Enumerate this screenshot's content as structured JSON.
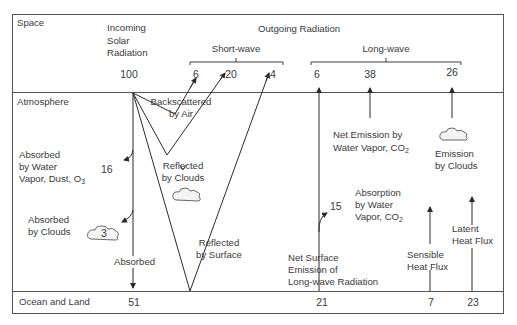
{
  "zones": {
    "space": "Space",
    "atmosphere": "Atmosphere",
    "surface": "Ocean and Land"
  },
  "headers": {
    "incoming": [
      "Incoming",
      "Solar",
      "Radiation"
    ],
    "outgoing": "Outgoing Radiation",
    "short_wave": "Short-wave",
    "long_wave": "Long-wave"
  },
  "top_values": {
    "incoming": "100",
    "backscattered": "6",
    "reflected_clouds": "20",
    "reflected_surface": "4",
    "lw_surface": "6",
    "lw_water_vapor": "38",
    "lw_clouds": "26"
  },
  "labels": {
    "backscattered": [
      "Backscattered",
      "by Air"
    ],
    "reflected_clouds": [
      "Reflected",
      "by Clouds"
    ],
    "reflected_surface": [
      "Reflected",
      "by Surface"
    ],
    "absorbed_water": [
      "Absorbed",
      "by Water",
      "Vapor, Dust, O"
    ],
    "absorbed_water_sub": "3",
    "absorbed_clouds": [
      "Absorbed",
      "by Clouds"
    ],
    "absorbed": "Absorbed",
    "net_emission": [
      "Net Emission by",
      "Water Vapor, CO"
    ],
    "net_emission_sub": "2",
    "emission_clouds": [
      "Emission",
      "by Clouds"
    ],
    "absorption_water": [
      "Absorption",
      "by Water",
      "Vapor, CO"
    ],
    "absorption_water_sub": "2",
    "net_surface": [
      "Net Surface",
      "Emission of",
      "Long-wave Radiation"
    ],
    "sensible": [
      "Sensible",
      "Heat Flux"
    ],
    "latent": [
      "Latent",
      "Heat Flux"
    ]
  },
  "mid_values": {
    "absorbed_water": "16",
    "absorbed_clouds": "3",
    "absorption_water": "15"
  },
  "bottom_values": {
    "absorbed": "51",
    "net_surface": "21",
    "sensible": "7",
    "latent": "23"
  },
  "colors": {
    "line": "#2a2a2a",
    "frame": "#555555",
    "text": "#3a3a3a",
    "background": "#ffffff"
  }
}
